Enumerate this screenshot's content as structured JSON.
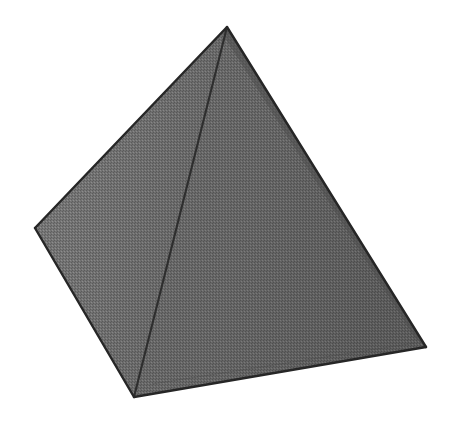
{
  "scene": {
    "title": "Square Pyramid",
    "object_name": "square-pyramid",
    "background_color": "#ffffff",
    "canvas": {
      "width": 457,
      "height": 421
    },
    "texture": "dithered-halftone-grain",
    "outline_color": "#2b2b2b",
    "outline_width": 2.2,
    "vertices": {
      "apex": {
        "label": "apex",
        "x": 227,
        "y": 27
      },
      "base_left": {
        "label": "base-left-corner",
        "x": 35,
        "y": 228
      },
      "base_front": {
        "label": "base-front-corner",
        "x": 134,
        "y": 397
      },
      "base_right": {
        "label": "base-right-corner",
        "x": 426,
        "y": 347
      }
    },
    "faces": [
      {
        "name": "left-face",
        "label": "Left lateral face",
        "fill": "#6f6f6f",
        "fill_light": "#7b7b7b",
        "fill_dark": "#616161",
        "points": "227,27 35,228 134,397"
      },
      {
        "name": "right-face",
        "label": "Right lateral face",
        "fill": "#666666",
        "fill_light": "#707070",
        "fill_dark": "#5a5a5a",
        "points": "227,27 134,397 426,347"
      }
    ],
    "edges": [
      {
        "name": "edge-apex-to-base-left",
        "label": "Apex to left base corner",
        "points": "227,27 35,228",
        "style": "silhouette"
      },
      {
        "name": "edge-apex-to-base-right",
        "label": "Apex to right base corner",
        "points": "227,27 426,347",
        "style": "silhouette"
      },
      {
        "name": "edge-apex-to-base-front",
        "label": "Apex to front base corner",
        "points": "227,27 134,397",
        "style": "front-ridge"
      },
      {
        "name": "edge-base-left-front",
        "label": "Base edge left to front",
        "points": "35,228 134,397",
        "style": "silhouette"
      },
      {
        "name": "edge-base-front-right",
        "label": "Base edge front to right",
        "points": "134,397 426,347",
        "style": "silhouette"
      }
    ],
    "hidden_edges": [
      {
        "name": "edge-hidden-back-right",
        "label": "Hidden back-right lateral edge",
        "points": "227,27 424,345",
        "style": "hidden-shadow"
      },
      {
        "name": "edge-hidden-base-back",
        "label": "Hidden back base edge",
        "points": "140,390 420,345",
        "style": "hidden-faint"
      }
    ]
  }
}
